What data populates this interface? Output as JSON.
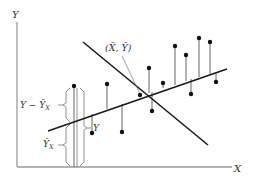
{
  "diagram": {
    "type": "scatter-with-regression",
    "axes": {
      "x_label": "X",
      "y_label": "Y"
    },
    "labels": {
      "mean_point": "(X̄, Ȳ)",
      "deviation_residual": "Y − Ȳ",
      "deviation_residual_sub": "X",
      "predicted": "Ȳ",
      "predicted_sub": "X",
      "observed": "Y"
    },
    "regression_line": {
      "x1": 48,
      "y1": 131,
      "x2": 227,
      "y2": 69
    },
    "cross_line": {
      "x1": 83,
      "y1": 42,
      "x2": 208,
      "y2": 145
    },
    "mean_point": {
      "x": 140,
      "y": 95
    },
    "points": [
      {
        "x": 74,
        "y": 86,
        "line_y": 120
      },
      {
        "x": 92,
        "y": 133,
        "line_y": 114
      },
      {
        "x": 107,
        "y": 84,
        "line_y": 109
      },
      {
        "x": 122,
        "y": 132,
        "line_y": 104
      },
      {
        "x": 149,
        "y": 68,
        "line_y": 93
      },
      {
        "x": 152,
        "y": 111,
        "line_y": 92
      },
      {
        "x": 163,
        "y": 83,
        "line_y": 88
      },
      {
        "x": 175,
        "y": 46,
        "line_y": 85
      },
      {
        "x": 186,
        "y": 55,
        "line_y": 81
      },
      {
        "x": 191,
        "y": 94,
        "line_y": 79
      },
      {
        "x": 199,
        "y": 38,
        "line_y": 77
      },
      {
        "x": 210,
        "y": 42,
        "line_y": 74
      },
      {
        "x": 216,
        "y": 82,
        "line_y": 72
      }
    ]
  }
}
